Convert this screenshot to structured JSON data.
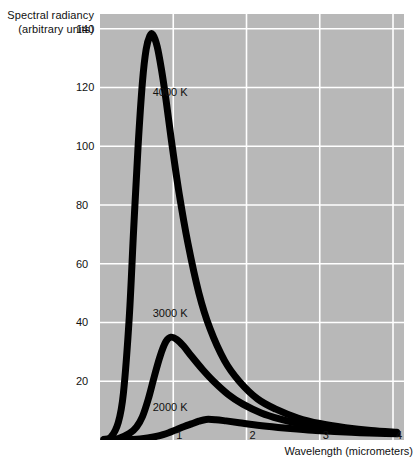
{
  "chart_data": {
    "type": "line",
    "title": "",
    "subtitle": "",
    "ylabel_line1": "Spectral radiancy",
    "ylabel_line2": "(arbitrary units)",
    "xlabel": "Wavelength (micrometers)",
    "xlim": [
      0,
      4.15
    ],
    "ylim": [
      0,
      145
    ],
    "grid": true,
    "grid_color": "#ffffff",
    "plot_background": "#b8b8b8",
    "curve_color": "#000000",
    "legend_position": "inline-annotations",
    "xticks": [
      "1",
      "2",
      "3",
      "4"
    ],
    "xtick_values": [
      1,
      2,
      3,
      4
    ],
    "yticks": [
      "20",
      "40",
      "60",
      "80",
      "100",
      "120",
      "140"
    ],
    "ytick_values": [
      20,
      40,
      60,
      80,
      100,
      120,
      140
    ],
    "annotations": [
      {
        "text": "4000 K",
        "x": 0.72,
        "y": 118
      },
      {
        "text": "3000 K",
        "x": 0.72,
        "y": 43
      },
      {
        "text": "2000 K",
        "x": 0.72,
        "y": 11
      }
    ],
    "series": [
      {
        "name": "4000 K",
        "label": "4000 K",
        "peak_wavelength": 0.72,
        "peak_value": 138,
        "x": [
          0.05,
          0.15,
          0.25,
          0.32,
          0.4,
          0.46,
          0.52,
          0.58,
          0.63,
          0.68,
          0.72,
          0.78,
          0.84,
          0.9,
          0.98,
          1.08,
          1.2,
          1.35,
          1.5,
          1.7,
          1.9,
          2.15,
          2.4,
          2.7,
          3.0,
          3.35,
          3.7,
          4.05
        ],
        "y": [
          0.2,
          1.0,
          6.0,
          16.0,
          42.0,
          72.0,
          100.0,
          122.0,
          133.0,
          137.5,
          138.0,
          134.0,
          126.0,
          116.0,
          101.0,
          84.0,
          67.0,
          50.0,
          38.0,
          27.0,
          20.0,
          14.0,
          10.5,
          7.5,
          5.6,
          4.2,
          3.2,
          2.6
        ]
      },
      {
        "name": "3000 K",
        "label": "3000 K",
        "peak_wavelength": 0.97,
        "peak_value": 35,
        "x": [
          0.1,
          0.25,
          0.4,
          0.5,
          0.58,
          0.66,
          0.74,
          0.82,
          0.9,
          0.97,
          1.05,
          1.14,
          1.25,
          1.4,
          1.55,
          1.75,
          1.95,
          2.2,
          2.45,
          2.75,
          3.05,
          3.4,
          3.75,
          4.05
        ],
        "y": [
          0.1,
          0.5,
          2.2,
          4.5,
          8.0,
          14.0,
          21.5,
          28.5,
          33.5,
          35.0,
          34.2,
          32.0,
          28.5,
          24.0,
          20.0,
          15.5,
          12.2,
          9.2,
          7.2,
          5.4,
          4.2,
          3.3,
          2.7,
          2.3
        ]
      },
      {
        "name": "2000 K",
        "label": "2000 K",
        "peak_wavelength": 1.45,
        "peak_value": 7.0,
        "x": [
          0.2,
          0.45,
          0.65,
          0.8,
          0.95,
          1.05,
          1.15,
          1.25,
          1.35,
          1.45,
          1.58,
          1.72,
          1.9,
          2.1,
          2.35,
          2.6,
          2.9,
          3.2,
          3.55,
          3.9,
          4.05
        ],
        "y": [
          0.05,
          0.2,
          0.7,
          1.4,
          2.6,
          3.6,
          4.6,
          5.5,
          6.4,
          7.0,
          6.9,
          6.5,
          5.9,
          5.2,
          4.5,
          3.9,
          3.3,
          2.9,
          2.5,
          2.2,
          2.1
        ]
      }
    ]
  }
}
